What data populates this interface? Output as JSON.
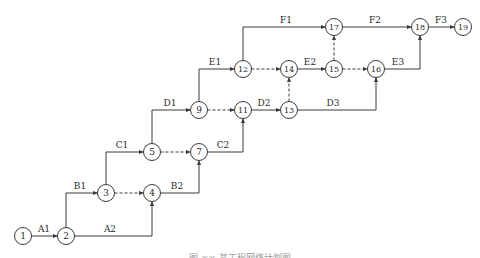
{
  "diagram": {
    "type": "activity-on-arrow network (double-code network plan)",
    "colors": {
      "line": "#3a3a3a",
      "node_fill": "#ffffff",
      "text": "#2a2a2a",
      "background": "#ffffff"
    },
    "node_radius": 8.5,
    "nodes": [
      {
        "id": "1",
        "x": 23,
        "y": 236
      },
      {
        "id": "2",
        "x": 66,
        "y": 236
      },
      {
        "id": "3",
        "x": 106,
        "y": 193
      },
      {
        "id": "4",
        "x": 152,
        "y": 193
      },
      {
        "id": "5",
        "x": 152,
        "y": 152
      },
      {
        "id": "7",
        "x": 199,
        "y": 152
      },
      {
        "id": "9",
        "x": 199,
        "y": 110
      },
      {
        "id": "11",
        "x": 243,
        "y": 110
      },
      {
        "id": "13",
        "x": 289,
        "y": 110
      },
      {
        "id": "12",
        "x": 243,
        "y": 69
      },
      {
        "id": "14",
        "x": 289,
        "y": 69
      },
      {
        "id": "15",
        "x": 334,
        "y": 69
      },
      {
        "id": "16",
        "x": 376,
        "y": 69
      },
      {
        "id": "17",
        "x": 334,
        "y": 27
      },
      {
        "id": "18",
        "x": 420,
        "y": 27
      },
      {
        "id": "19",
        "x": 463,
        "y": 27
      }
    ],
    "activities": [
      {
        "label": "A1",
        "from": "1",
        "to": "2",
        "dashed": false,
        "route": "straight",
        "label_x": 44,
        "label_y": 232
      },
      {
        "label": "A2",
        "from": "2",
        "to": "4",
        "dashed": false,
        "route": "right-up",
        "label_x": 110,
        "label_y": 232
      },
      {
        "label": "B1",
        "from": "2",
        "to": "3",
        "dashed": false,
        "route": "up-right",
        "label_x": 80,
        "label_y": 189
      },
      {
        "label": "",
        "from": "3",
        "to": "4",
        "dashed": true,
        "route": "straight"
      },
      {
        "label": "C1",
        "from": "3",
        "to": "5",
        "dashed": false,
        "route": "up-right",
        "label_x": 122,
        "label_y": 148
      },
      {
        "label": "B2",
        "from": "4",
        "to": "7",
        "dashed": false,
        "route": "right-up",
        "label_x": 177,
        "label_y": 189
      },
      {
        "label": "",
        "from": "5",
        "to": "7",
        "dashed": true,
        "route": "straight"
      },
      {
        "label": "D1",
        "from": "5",
        "to": "9",
        "dashed": false,
        "route": "up-right",
        "label_x": 170,
        "label_y": 106
      },
      {
        "label": "C2",
        "from": "7",
        "to": "11",
        "dashed": false,
        "route": "right-up",
        "label_x": 223,
        "label_y": 148
      },
      {
        "label": "",
        "from": "9",
        "to": "11",
        "dashed": true,
        "route": "straight"
      },
      {
        "label": "E1",
        "from": "9",
        "to": "12",
        "dashed": false,
        "route": "up-right",
        "label_x": 215,
        "label_y": 65
      },
      {
        "label": "D2",
        "from": "11",
        "to": "13",
        "dashed": false,
        "route": "straight",
        "label_x": 264,
        "label_y": 106
      },
      {
        "label": "",
        "from": "13",
        "to": "14",
        "dashed": true,
        "route": "straight"
      },
      {
        "label": "D3",
        "from": "13",
        "to": "16",
        "dashed": false,
        "route": "right-up",
        "label_x": 333,
        "label_y": 106
      },
      {
        "label": "",
        "from": "12",
        "to": "14",
        "dashed": true,
        "route": "straight"
      },
      {
        "label": "F1",
        "from": "12",
        "to": "17",
        "dashed": false,
        "route": "up-right",
        "label_x": 286,
        "label_y": 23
      },
      {
        "label": "E2",
        "from": "14",
        "to": "15",
        "dashed": false,
        "route": "straight",
        "label_x": 310,
        "label_y": 65
      },
      {
        "label": "",
        "from": "15",
        "to": "17",
        "dashed": true,
        "route": "straight"
      },
      {
        "label": "",
        "from": "15",
        "to": "16",
        "dashed": true,
        "route": "straight"
      },
      {
        "label": "E3",
        "from": "16",
        "to": "18",
        "dashed": false,
        "route": "right-up",
        "label_x": 398,
        "label_y": 65
      },
      {
        "label": "F2",
        "from": "17",
        "to": "18",
        "dashed": false,
        "route": "straight",
        "label_x": 375,
        "label_y": 23
      },
      {
        "label": "F3",
        "from": "18",
        "to": "19",
        "dashed": false,
        "route": "straight",
        "label_x": 441,
        "label_y": 23
      }
    ]
  },
  "caption": "图 ×× 某工程网络计划图"
}
